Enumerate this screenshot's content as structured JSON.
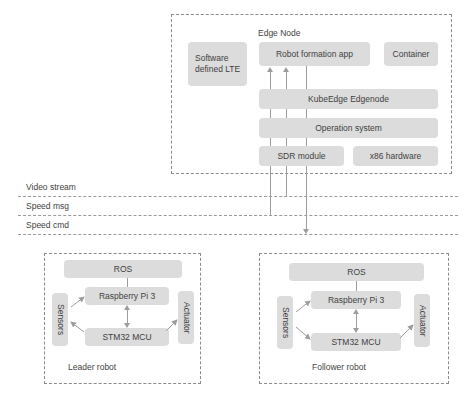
{
  "diagram": {
    "colors": {
      "node_fill": "#dcdcdc",
      "dash_border": "#8a8a8a",
      "connector": "#9d9d9d",
      "text": "#3f3f3f",
      "background": "#ffffff"
    }
  },
  "edge_node": {
    "label": "Edge Node",
    "boxes": {
      "sdn_lte": "Software defined LTE",
      "robot_app": "Robot formation app",
      "container": "Container",
      "kubeedge": "KubeEdge Edgenode",
      "os": "Operation system",
      "sdr": "SDR module",
      "hardware": "x86 hardware"
    }
  },
  "channels": [
    {
      "label": "Video stream"
    },
    {
      "label": "Speed msg"
    },
    {
      "label": "Speed cmd"
    }
  ],
  "leader_robot": {
    "caption": "Leader robot",
    "boxes": {
      "ros": "ROS",
      "rpi": "Raspberry Pi 3",
      "mcu": "STM32 MCU",
      "sensors": "Sensors",
      "actuator": "Actuator"
    }
  },
  "follower_robot": {
    "caption": "Follower robot",
    "boxes": {
      "ros": "ROS",
      "rpi": "Raspberry Pi 3",
      "mcu": "STM32 MCU",
      "sensors": "Sensors",
      "actuator": "Actuator"
    }
  }
}
